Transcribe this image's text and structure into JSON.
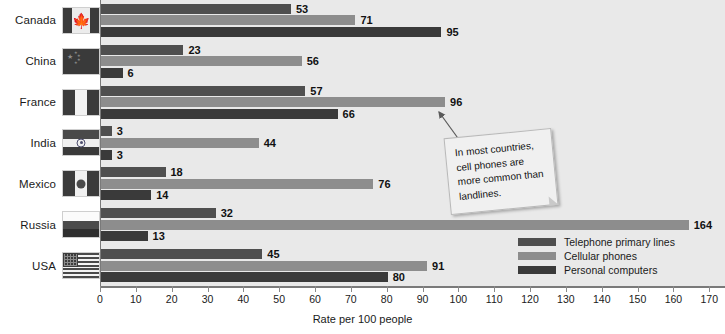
{
  "chart_data": {
    "type": "bar",
    "orientation": "horizontal",
    "title": "",
    "xlabel": "Rate per 100 people",
    "ylabel": "",
    "xlim": [
      0,
      170
    ],
    "xticks": [
      0,
      10,
      20,
      30,
      40,
      50,
      60,
      70,
      80,
      90,
      100,
      110,
      120,
      130,
      140,
      150,
      160,
      170
    ],
    "grid": false,
    "legend_position": "bottom-right",
    "categories": [
      "Canada",
      "China",
      "France",
      "India",
      "Mexico",
      "Russia",
      "USA"
    ],
    "series": [
      {
        "name": "Telephone primary lines",
        "color": "#4f4f4f",
        "values": [
          53,
          23,
          57,
          3,
          18,
          32,
          45
        ]
      },
      {
        "name": "Cellular phones",
        "color": "#8d8d8d",
        "values": [
          71,
          56,
          44,
          44,
          76,
          164,
          91
        ]
      },
      {
        "name": "Personal computers",
        "color": "#3a3a3a",
        "values": [
          95,
          6,
          66,
          3,
          14,
          13,
          80
        ]
      }
    ],
    "annotations": [
      {
        "text": "In most countries, cell phones are more common than landlines.",
        "points_to": "France cellular phones bar (96)"
      }
    ]
  },
  "axis": {
    "title": "Rate per 100 people",
    "ticks": [
      "0",
      "10",
      "20",
      "30",
      "40",
      "50",
      "60",
      "70",
      "80",
      "90",
      "100",
      "110",
      "120",
      "130",
      "140",
      "150",
      "160",
      "170"
    ]
  },
  "categories": [
    {
      "label": "Canada",
      "flag": "flag-canada"
    },
    {
      "label": "China",
      "flag": "flag-china"
    },
    {
      "label": "France",
      "flag": "flag-france"
    },
    {
      "label": "India",
      "flag": "flag-india"
    },
    {
      "label": "Mexico",
      "flag": "flag-mexico"
    },
    {
      "label": "Russia",
      "flag": "flag-russia"
    },
    {
      "label": "USA",
      "flag": "flag-usa"
    }
  ],
  "rows": [
    {
      "country": "Canada",
      "telephone": 53,
      "cellular": 71,
      "computers": 95
    },
    {
      "country": "China",
      "telephone": 23,
      "cellular": 56,
      "computers": 6
    },
    {
      "country": "France",
      "telephone": 57,
      "cellular": 96,
      "computers": 66
    },
    {
      "country": "India",
      "telephone": 3,
      "cellular": 44,
      "computers": 3
    },
    {
      "country": "Mexico",
      "telephone": 18,
      "cellular": 76,
      "computers": 14
    },
    {
      "country": "Russia",
      "telephone": 32,
      "cellular": 164,
      "computers": 13
    },
    {
      "country": "USA",
      "telephone": 45,
      "cellular": 91,
      "computers": 80
    }
  ],
  "legend": {
    "items": [
      {
        "label": "Telephone primary lines",
        "color": "#4f4f4f"
      },
      {
        "label": "Cellular phones",
        "color": "#8d8d8d"
      },
      {
        "label": "Personal computers",
        "color": "#3a3a3a"
      }
    ]
  },
  "callout": {
    "text": "In most countries, cell phones are more common than landlines."
  },
  "colors": {
    "plot_background": "#e9e9e9",
    "page_background": "#ffffff",
    "axis": "#7a7a7a",
    "telephone": "#4f4f4f",
    "cellular": "#8d8d8d",
    "computers": "#3a3a3a"
  }
}
